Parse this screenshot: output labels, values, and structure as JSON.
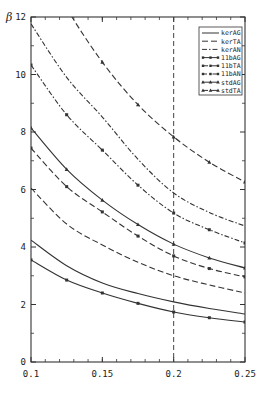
{
  "chart_data": {
    "type": "line",
    "title": "",
    "xlabel": "",
    "ylabel": "β",
    "xlim": [
      0.1,
      0.25
    ],
    "ylim": [
      0,
      12
    ],
    "xticks": [
      0.1,
      0.15,
      0.2,
      0.25
    ],
    "xtick_labels": [
      "0.1",
      "0.15",
      "0.2",
      "0.25"
    ],
    "yticks": [
      0,
      2,
      4,
      6,
      8,
      10,
      12
    ],
    "ytick_labels": [
      "0",
      "2",
      "4",
      "6",
      "8",
      "10",
      "12"
    ],
    "grid": false,
    "legend_position": "upper right",
    "annotations": [
      {
        "type": "vertical-dashed-line",
        "x": 0.2
      }
    ],
    "x": [
      0.1,
      0.125,
      0.15,
      0.175,
      0.2,
      0.225,
      0.25
    ],
    "series": [
      {
        "name": "kerAG",
        "style": "solid",
        "marker": "none",
        "values": [
          4.24,
          3.35,
          2.75,
          2.38,
          2.09,
          1.86,
          1.67
        ]
      },
      {
        "name": "kerTA",
        "style": "dashed",
        "marker": "none",
        "values": [
          6.05,
          4.8,
          4.07,
          3.47,
          3.0,
          2.68,
          2.4
        ]
      },
      {
        "name": "kerAN",
        "style": "dash-dot",
        "marker": "none",
        "values": [
          11.76,
          9.9,
          8.52,
          7.05,
          5.88,
          5.2,
          4.73
        ]
      },
      {
        "name": "11bAG",
        "style": "solid",
        "marker": "x",
        "values": [
          3.55,
          2.85,
          2.4,
          2.04,
          1.74,
          1.54,
          1.39
        ]
      },
      {
        "name": "11bTA",
        "style": "dashed",
        "marker": "x",
        "values": [
          7.44,
          6.1,
          5.22,
          4.38,
          3.69,
          3.25,
          2.96
        ]
      },
      {
        "name": "11bAN",
        "style": "dash-dot",
        "marker": "x",
        "values": [
          10.33,
          8.6,
          7.37,
          6.15,
          5.18,
          4.6,
          4.14
        ]
      },
      {
        "name": "stdAG",
        "style": "solid",
        "marker": "triangle",
        "values": [
          8.14,
          6.7,
          5.63,
          4.78,
          4.1,
          3.62,
          3.27
        ]
      },
      {
        "name": "stdTA",
        "style": "dashed",
        "marker": "triangle",
        "values": [
          14.5,
          12.3,
          10.43,
          8.95,
          7.83,
          6.95,
          6.26
        ]
      }
    ]
  },
  "legend": {
    "items": [
      "kerAG",
      "kerTA",
      "kerAN",
      "11bAG",
      "11bTA",
      "11bAN",
      "stdAG",
      "stdTA"
    ]
  },
  "axis": {
    "ylabel": "β"
  }
}
